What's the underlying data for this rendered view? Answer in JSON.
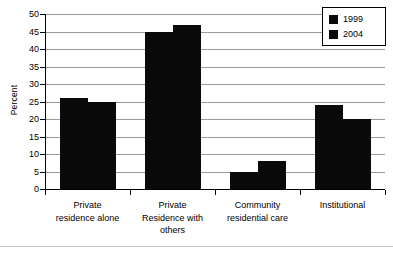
{
  "chart_data": {
    "type": "bar",
    "title": "",
    "xlabel": "",
    "ylabel": "Percent",
    "ylim": [
      0,
      50
    ],
    "ytick_step": 5,
    "yticks": [
      "0",
      "5",
      "10",
      "15",
      "20",
      "25",
      "30",
      "35",
      "40",
      "45",
      "50"
    ],
    "grid": true,
    "legend_position": "top-right",
    "categories": [
      "Private residence alone",
      "Private Residence with others",
      "Community residential care",
      "Institutional"
    ],
    "category_lines": [
      [
        "Private",
        "residence alone"
      ],
      [
        "Private",
        "Residence with",
        "others"
      ],
      [
        "Community",
        "residential care"
      ],
      [
        "Institutional"
      ]
    ],
    "series": [
      {
        "name": "1999",
        "color": "#0a0a0a",
        "values": [
          26,
          45,
          5,
          24
        ]
      },
      {
        "name": "2004",
        "color": "#0a0a0a",
        "values": [
          25,
          47,
          8,
          20
        ]
      }
    ]
  },
  "legend": {
    "items": [
      {
        "label": "1999",
        "swatch": "legend-swatch-1999"
      },
      {
        "label": "2004",
        "swatch": "legend-swatch-2004"
      }
    ]
  }
}
